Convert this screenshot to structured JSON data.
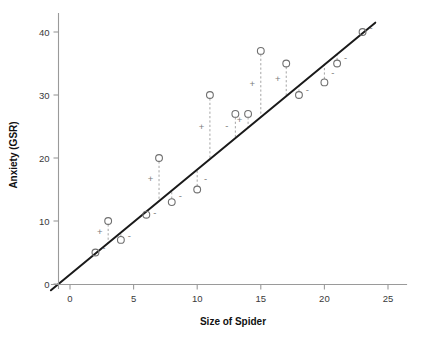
{
  "chart_data": {
    "type": "scatter",
    "title": "",
    "xlabel": "Size of Spider",
    "ylabel": "Anxiety (GSR)",
    "xlim": [
      -1.5,
      26.5
    ],
    "ylim": [
      -0.8,
      43
    ],
    "xticks": [
      0,
      5,
      10,
      15,
      20,
      25
    ],
    "yticks": [
      0,
      10,
      20,
      30,
      40
    ],
    "xtick_labels": [
      "0",
      "5",
      "10",
      "15",
      "20",
      "25"
    ],
    "ytick_labels": [
      "0",
      "10",
      "20",
      "30",
      "40"
    ],
    "grid": false,
    "legend": "none",
    "series": [
      {
        "name": "observations",
        "marker": "open-circle",
        "color": "#6f6f6f",
        "x": [
          2,
          3,
          4,
          6,
          7,
          8,
          10,
          11,
          13,
          14,
          15,
          17,
          18,
          20,
          21,
          23
        ],
        "y": [
          5,
          10,
          7,
          11,
          20,
          13,
          15,
          30,
          27,
          27,
          37,
          35,
          30,
          32,
          35,
          40
        ]
      }
    ],
    "fit_line": {
      "name": "regression-line",
      "type": "linear",
      "intercept": 1.5,
      "slope": 1.666,
      "x_start": -1.5,
      "x_end": 24.0,
      "color": "#1a1a1a"
    },
    "residuals": {
      "description": "dashed vertical segments from each point to the regression line, annotated + above line or - below line",
      "signs": [
        "-",
        "+",
        "-",
        "-",
        "+",
        "-",
        "-",
        "+",
        "-",
        "+",
        "+",
        "+",
        "-",
        "-",
        "-",
        "-"
      ],
      "values": [
        -3.2,
        3.5,
        -1.2,
        -0.5,
        5.3,
        -1.8,
        -3.2,
        10.2,
        -0.8,
        1.9,
        10.5,
        4.2,
        -1.8,
        -2.8,
        -1.5,
        0.0
      ]
    },
    "colors": {
      "axis": "#9a9a9a",
      "point": "#6f6f6f",
      "line": "#1a1a1a",
      "residual": "#9b9b9b",
      "text": "#111111",
      "background": "#ffffff"
    }
  }
}
